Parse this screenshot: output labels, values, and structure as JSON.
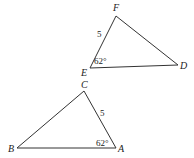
{
  "diagram": {
    "type": "geometry-triangles",
    "triangles": [
      {
        "name": "DEF",
        "vertices": {
          "F": {
            "label": "F",
            "x": 116,
            "y": 16
          },
          "E": {
            "label": "E",
            "x": 90,
            "y": 68
          },
          "D": {
            "label": "D",
            "x": 178,
            "y": 65
          }
        },
        "side_label": {
          "side": "EF",
          "text": "5"
        },
        "angle_label": {
          "vertex": "E",
          "text": "62°"
        }
      },
      {
        "name": "ABC",
        "vertices": {
          "C": {
            "label": "C",
            "x": 84,
            "y": 91
          },
          "B": {
            "label": "B",
            "x": 17,
            "y": 148
          },
          "A": {
            "label": "A",
            "x": 116,
            "y": 148
          }
        },
        "side_label": {
          "side": "CA",
          "text": "5"
        },
        "angle_label": {
          "vertex": "A",
          "text": "62°"
        }
      }
    ],
    "stroke_color": "#333333"
  }
}
